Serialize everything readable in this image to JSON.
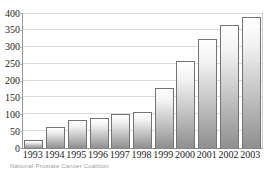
{
  "chart_data": {
    "type": "bar",
    "title": "",
    "xlabel": "",
    "ylabel": "",
    "categories": [
      "1993",
      "1994",
      "1995",
      "1996",
      "1997",
      "1998",
      "1999",
      "2000",
      "2001",
      "2002",
      "2003"
    ],
    "values": [
      23,
      62,
      82,
      90,
      100,
      108,
      177,
      259,
      322,
      364,
      387
    ],
    "ylim": [
      0,
      400
    ],
    "yticks": [
      0,
      50,
      100,
      150,
      200,
      250,
      300,
      350,
      400
    ],
    "grid": true,
    "legend": "none",
    "caption": "National Prostate Cancer Coalition",
    "colors": {
      "background": "#ffffff",
      "bar_fill_top": "#ffffff",
      "bar_fill_bottom": "#8f8f8f",
      "bar_border": "#747474",
      "gridline": "#dcdcdc",
      "axis": "#9a9a9a",
      "tick_label": "#1d1d1d",
      "caption_text": "#9b9b9b"
    }
  }
}
